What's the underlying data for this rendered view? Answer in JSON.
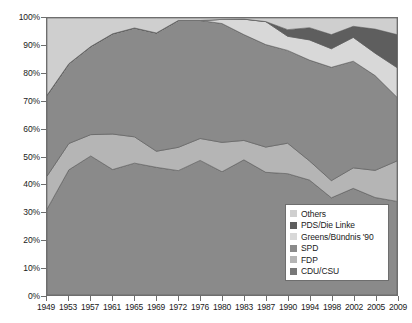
{
  "chart_data": {
    "type": "area",
    "stacked": true,
    "normalized": true,
    "title": "",
    "subtitle": "",
    "xlabel": "",
    "ylabel": "",
    "grid": false,
    "legend_position": "inside-bottom-right",
    "ylim": [
      0,
      100
    ],
    "ytick_labels": [
      "0%",
      "10%",
      "20%",
      "30%",
      "40%",
      "50%",
      "60%",
      "70%",
      "80%",
      "90%",
      "100%"
    ],
    "ytick_values": [
      0,
      10,
      20,
      30,
      40,
      50,
      60,
      70,
      80,
      90,
      100
    ],
    "categories": [
      "1949",
      "1953",
      "1957",
      "1961",
      "1965",
      "1969",
      "1972",
      "1976",
      "1980",
      "1983",
      "1987",
      "1990",
      "1994",
      "1998",
      "2002",
      "2005",
      "2009"
    ],
    "x": [
      1949,
      1953,
      1957,
      1961,
      1965,
      1969,
      1972,
      1976,
      1980,
      1983,
      1987,
      1990,
      1994,
      1998,
      2002,
      2005,
      2009
    ],
    "series": [
      {
        "name": "CDU/CSU",
        "color": "#8a8a8a",
        "values": [
          31.0,
          45.2,
          50.2,
          45.3,
          47.6,
          46.1,
          44.9,
          48.6,
          44.5,
          48.8,
          44.3,
          43.8,
          41.5,
          35.1,
          38.5,
          35.2,
          33.8
        ]
      },
      {
        "name": "FDP",
        "color": "#b5b5b5",
        "values": [
          11.9,
          9.5,
          7.7,
          12.8,
          9.5,
          5.8,
          8.4,
          7.9,
          10.6,
          7.0,
          9.1,
          11.0,
          6.9,
          6.2,
          7.4,
          9.8,
          14.6
        ]
      },
      {
        "name": "SPD",
        "color": "#8a8a8a",
        "values": [
          29.2,
          28.8,
          31.8,
          36.2,
          39.3,
          42.7,
          45.8,
          42.6,
          42.9,
          38.2,
          37.0,
          33.5,
          36.4,
          40.9,
          38.5,
          34.2,
          23.0
        ]
      },
      {
        "name": "Greens/Bündnis '90",
        "color": "#d8d8d8",
        "values": [
          0.0,
          0.0,
          0.0,
          0.0,
          0.0,
          0.0,
          0.0,
          0.0,
          1.5,
          5.6,
          8.3,
          5.1,
          7.3,
          6.7,
          8.6,
          8.1,
          10.7
        ]
      },
      {
        "name": "PDS/Die Linke",
        "color": "#5e5e5e",
        "values": [
          0.0,
          0.0,
          0.0,
          0.0,
          0.0,
          0.0,
          0.0,
          0.0,
          0.0,
          0.0,
          0.0,
          2.4,
          4.4,
          5.1,
          4.0,
          8.7,
          11.9
        ]
      },
      {
        "name": "Others",
        "color": "#cfcfcf",
        "values": [
          27.9,
          16.5,
          10.3,
          5.7,
          3.6,
          5.4,
          0.9,
          0.9,
          0.5,
          0.4,
          1.3,
          4.2,
          3.5,
          6.0,
          3.0,
          4.0,
          6.0
        ]
      }
    ],
    "stack_order_bottom_to_top": [
      "CDU/CSU",
      "FDP",
      "SPD",
      "Greens/Bündnis '90",
      "PDS/Die Linke",
      "Others"
    ]
  },
  "legend": {
    "items": [
      {
        "label": "Others",
        "color": "#cfcfcf"
      },
      {
        "label": "PDS/Die Linke",
        "color": "#5e5e5e"
      },
      {
        "label": "Greens/Bündnis '90",
        "color": "#d8d8d8"
      },
      {
        "label": "SPD",
        "color": "#8a8a8a"
      },
      {
        "label": "FDP",
        "color": "#b5b5b5"
      },
      {
        "label": "CDU/CSU",
        "color": "#787878"
      }
    ]
  },
  "style": {
    "plot_background": "#f2f2f2",
    "axis_color": "#6e6e6e",
    "text_color": "#1a1a1a",
    "area_outline": "#5a5a5a"
  }
}
